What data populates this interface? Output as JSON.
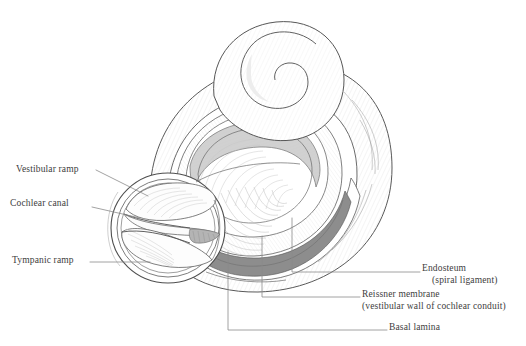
{
  "figure": {
    "ink": "#4a4a4a",
    "shade_light": "#d0d0d0",
    "shade_mid": "#a8a8a8",
    "shade_dark": "#7f7f7f",
    "background": "#ffffff"
  },
  "labels": {
    "left": [
      {
        "id": "vestibular-ramp",
        "text": "Vestibular ramp"
      },
      {
        "id": "cochlear-canal",
        "text": "Cochlear canal"
      },
      {
        "id": "tympanic-ramp",
        "text": "Tympanic ramp"
      }
    ],
    "right": [
      {
        "id": "endosteum",
        "text": "Endosteum",
        "sub": "(spiral ligament)"
      },
      {
        "id": "reissner-membrane",
        "text": "Reissner membrane",
        "sub": "(vestibular wall of cochlear conduit)"
      },
      {
        "id": "basal-lamina",
        "text": "Basal lamina",
        "sub": ""
      }
    ]
  }
}
